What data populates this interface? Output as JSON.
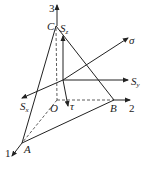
{
  "diagram": {
    "title": "",
    "axes": [
      {
        "id": "axis-1",
        "label": "1"
      },
      {
        "id": "axis-2",
        "label": "2"
      },
      {
        "id": "axis-3",
        "label": "3"
      }
    ],
    "points": {
      "A": "A",
      "B": "B",
      "C": "C",
      "O": "O"
    },
    "vectors": {
      "Sz": {
        "main": "S",
        "sub": "z"
      },
      "Sy": {
        "main": "S",
        "sub": "y"
      },
      "Sx": {
        "main": "S",
        "sub": "x"
      },
      "sigma": "σ",
      "tau": "τ"
    },
    "colors": {
      "stroke": "#222222",
      "background": "#ffffff"
    }
  }
}
